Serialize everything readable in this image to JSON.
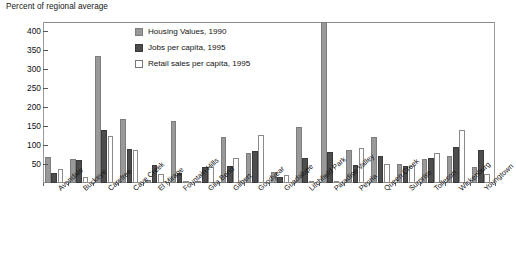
{
  "chart_data": {
    "type": "bar",
    "title": "Percent of regional average",
    "xlabel": "",
    "ylabel": "Percent of regional average",
    "ylim": [
      0,
      425
    ],
    "yticks": [
      50,
      100,
      150,
      200,
      250,
      300,
      350,
      400
    ],
    "grid": false,
    "legend_position": "top-center-inside",
    "categories": [
      "Avondale",
      "Buckeye",
      "Carefree",
      "Cave Creek",
      "El Mirage",
      "Fountain Hills",
      "Gila Bend",
      "Gilbert",
      "Goodyear",
      "Guadalupe",
      "Litchfield Park",
      "Paradise Valley",
      "Peoria",
      "Queen Creek",
      "Surprise",
      "Tolleson",
      "Wickenburg",
      "Youngtown"
    ],
    "series": [
      {
        "name": "Housing Values, 1990",
        "color": "#999999",
        "values": [
          68,
          64,
          334,
          168,
          8,
          163,
          5,
          122,
          78,
          30,
          148,
          425,
          88,
          121,
          49,
          63,
          72,
          42
        ]
      },
      {
        "name": "Jobs per capita, 1995",
        "color": "#4d4d4d",
        "values": [
          27,
          60,
          141,
          91,
          47,
          26,
          41,
          46,
          85,
          17,
          65,
          81,
          48,
          72,
          44,
          65,
          95,
          88
        ]
      },
      {
        "name": "Retail sales per capita, 1995",
        "color": "#ffffff",
        "values": [
          38,
          16,
          123,
          86,
          24,
          6,
          41,
          66,
          128,
          21,
          5,
          3,
          92,
          51,
          44,
          80,
          140,
          24
        ]
      }
    ]
  },
  "legend": {
    "items": [
      {
        "label": "Housing Values, 1990",
        "swatch": "gray"
      },
      {
        "label": "Jobs per capita, 1995",
        "swatch": "dark"
      },
      {
        "label": "Retail sales per capita, 1995",
        "swatch": "white"
      }
    ]
  },
  "axis": {
    "title": "Percent of regional average"
  }
}
